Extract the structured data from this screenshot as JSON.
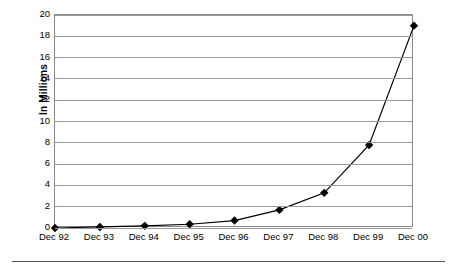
{
  "chart_data": {
    "type": "line",
    "title": "",
    "xlabel": "",
    "ylabel": "In Millions",
    "categories": [
      "Dec 92",
      "Dec 93",
      "Dec 94",
      "Dec 95",
      "Dec 96",
      "Dec 97",
      "Dec 98",
      "Dec 99",
      "Dec 00"
    ],
    "values": [
      0.0,
      0.1,
      0.2,
      0.35,
      0.7,
      1.7,
      3.3,
      7.8,
      19.0
    ],
    "series": [
      {
        "name": "In Millions",
        "values": [
          0.0,
          0.1,
          0.2,
          0.35,
          0.7,
          1.7,
          3.3,
          7.8,
          19.0
        ]
      }
    ],
    "ylim": [
      0,
      20
    ],
    "y_ticks": [
      0,
      2,
      4,
      6,
      8,
      10,
      12,
      14,
      16,
      18,
      20
    ],
    "y_tick_labels": [
      "0",
      "2",
      "4",
      "6",
      "8",
      "10",
      "12",
      "14",
      "16",
      "18",
      "20"
    ],
    "grid": true,
    "legend": "none",
    "marker": "diamond",
    "line_color": "#000000",
    "marker_color": "#000000",
    "grid_color": "#9a9a9a",
    "plot_border_color": "#8a8a8a",
    "background_color": "#ffffff"
  }
}
